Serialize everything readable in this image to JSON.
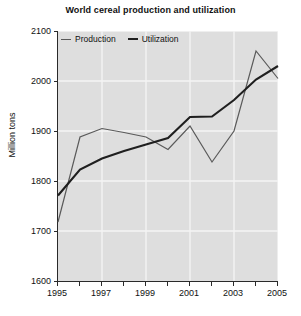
{
  "chart_data": {
    "type": "line",
    "title": "World cereal production and utilization",
    "xlabel": "",
    "ylabel": "Million tons",
    "x": [
      1995,
      1996,
      1997,
      1998,
      1999,
      2000,
      2001,
      2002,
      2003,
      2004,
      2005
    ],
    "xlim": [
      1995,
      2005
    ],
    "ylim": [
      1600,
      2100
    ],
    "y_ticks": [
      1600,
      1700,
      1800,
      1900,
      2000,
      2100
    ],
    "x_ticks": [
      1995,
      1996,
      1997,
      1998,
      1999,
      2000,
      2001,
      2002,
      2003,
      2004,
      2005
    ],
    "x_tick_labels": [
      "1995",
      "",
      "1997",
      "",
      "1999",
      "",
      "2001",
      "",
      "2003",
      "",
      "2005"
    ],
    "grid": true,
    "legend_position": "top-left",
    "series": [
      {
        "name": "Production",
        "color": "#5a5a5a",
        "line_width": 1.2,
        "values": [
          1718,
          1888,
          1905,
          1897,
          1888,
          1863,
          1910,
          1838,
          1900,
          2060,
          2005
        ]
      },
      {
        "name": "Utilization",
        "color": "#1f1f1f",
        "line_width": 2.1,
        "values": [
          1771,
          1823,
          1845,
          1860,
          1873,
          1886,
          1928,
          1929,
          1962,
          2003,
          2030
        ]
      }
    ],
    "plot_background": "#dedede",
    "grid_color": "#f4f4f4",
    "axis_color": "#2a2a2a"
  },
  "legend": {
    "items": [
      {
        "label": "Production"
      },
      {
        "label": "Utilization"
      }
    ]
  }
}
